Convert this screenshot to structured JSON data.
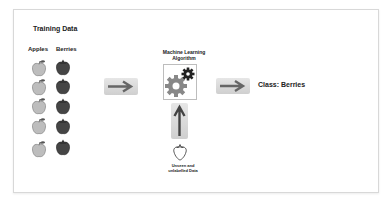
{
  "diagram": {
    "title": "Training Data",
    "columns": [
      {
        "label": "Apples",
        "count": 5,
        "color": "#bdbdbd"
      },
      {
        "label": "Berries",
        "count": 5,
        "color": "#454545"
      }
    ],
    "algorithm": {
      "label_line1": "Machine Learning",
      "label_line2": "Algorithm",
      "icon": "gears-icon"
    },
    "input": {
      "label_line1": "Unseen and",
      "label_line2": "unlabelled Data",
      "icon": "strawberry-icon"
    },
    "result": "Class: Berries",
    "colors": {
      "arrow": "#666666",
      "arrow_box": "#d6d6d6",
      "gear_large": "#888888",
      "gear_small": "#222222",
      "frame_border": "#d8d8d8"
    }
  }
}
